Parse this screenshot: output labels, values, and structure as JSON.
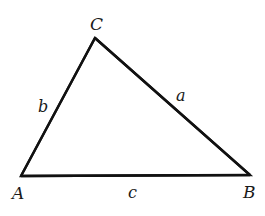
{
  "diagram": {
    "type": "triangle",
    "vertices": {
      "A": {
        "label": "A",
        "x": 21,
        "y": 176
      },
      "B": {
        "label": "B",
        "x": 250,
        "y": 175
      },
      "C": {
        "label": "C",
        "x": 95,
        "y": 38
      }
    },
    "sides": {
      "a": {
        "label": "a",
        "from": "B",
        "to": "C"
      },
      "b": {
        "label": "b",
        "from": "A",
        "to": "C"
      },
      "c": {
        "label": "c",
        "from": "A",
        "to": "B"
      }
    },
    "colors": {
      "stroke": "#111111",
      "text": "#1a1a1a",
      "background": "#ffffff"
    }
  }
}
